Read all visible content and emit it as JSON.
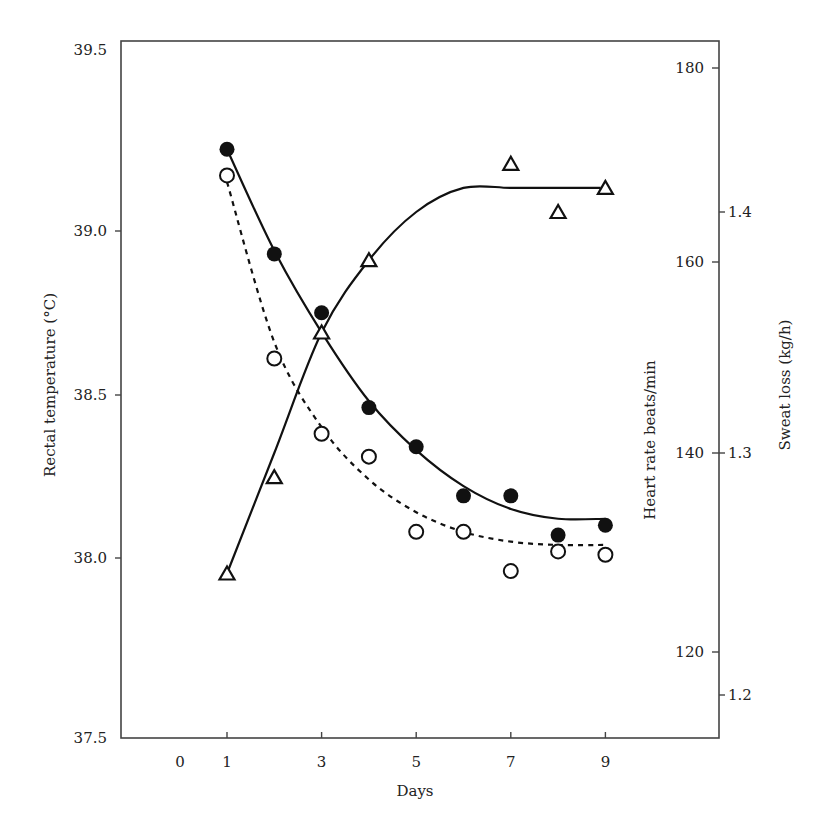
{
  "chart_data": {
    "type": "scatter",
    "title": "",
    "xlabel": "Days",
    "ylabel": "Rectal temperature (°C)",
    "ylabel_right_1": "Heart rate beats/min",
    "ylabel_right_2": "Sweat loss (kg/h)",
    "x_ticks": [
      "0",
      "1",
      "3",
      "5",
      "7",
      "9"
    ],
    "y_ticks_left": [
      "37.5",
      "38.0",
      "38.5",
      "39.0",
      "39.5"
    ],
    "y_ticks_right_heart_rate": [
      "120",
      "140",
      "160",
      "180"
    ],
    "y_ticks_right_sweat_loss": [
      "1.2",
      "1.3",
      "1.4"
    ],
    "xlim": [
      -0.2,
      11
    ],
    "ylim_left": [
      37.5,
      39.5
    ],
    "ylim_right_heart_rate": [
      113,
      182
    ],
    "ylim_right_sweat_loss": [
      1.17,
      1.45
    ],
    "grid": false,
    "legend": "none",
    "series": [
      {
        "name": "Filled circles (solid fitted curve)",
        "marker": "filled-circle",
        "line": "solid",
        "axis": "left",
        "x": [
          1,
          2,
          3,
          4,
          5,
          6,
          7,
          8,
          9
        ],
        "values": [
          39.25,
          38.93,
          38.75,
          38.46,
          38.34,
          38.19,
          38.19,
          38.07,
          38.1
        ]
      },
      {
        "name": "Open circles (dashed fitted curve)",
        "marker": "open-circle",
        "line": "dashed",
        "axis": "left",
        "x": [
          1,
          2,
          3,
          4,
          5,
          6,
          7,
          8,
          9
        ],
        "values": [
          39.17,
          38.61,
          38.38,
          38.31,
          38.08,
          38.08,
          37.96,
          38.02,
          38.01
        ]
      },
      {
        "name": "Open triangles (solid fitted curve)",
        "marker": "open-triangle",
        "line": "solid",
        "axis": "right-sweat-loss",
        "x": [
          1,
          2,
          3,
          4,
          7,
          8,
          9
        ],
        "values": [
          1.25,
          1.29,
          1.35,
          1.38,
          1.42,
          1.4,
          1.41
        ]
      }
    ],
    "fitted_curves": {
      "filled_circles": [
        [
          1,
          39.25
        ],
        [
          2,
          38.94
        ],
        [
          3,
          38.69
        ],
        [
          4,
          38.48
        ],
        [
          5,
          38.33
        ],
        [
          6,
          38.22
        ],
        [
          7,
          38.15
        ],
        [
          8,
          38.12
        ],
        [
          9,
          38.12
        ]
      ],
      "open_circles": [
        [
          1,
          39.15
        ],
        [
          2,
          38.66
        ],
        [
          3,
          38.4
        ],
        [
          4,
          38.24
        ],
        [
          5,
          38.14
        ],
        [
          6,
          38.08
        ],
        [
          7,
          38.05
        ],
        [
          8,
          38.04
        ],
        [
          9,
          38.04
        ]
      ],
      "open_triangles": [
        [
          1,
          1.25
        ],
        [
          2,
          1.3
        ],
        [
          3,
          1.35
        ],
        [
          4,
          1.38
        ],
        [
          5,
          1.4
        ],
        [
          6,
          1.41
        ],
        [
          7,
          1.41
        ],
        [
          8,
          1.41
        ],
        [
          8.9,
          1.41
        ]
      ]
    }
  },
  "colors": {
    "axis": "#333333",
    "marker": "#111111",
    "background": "#ffffff"
  }
}
